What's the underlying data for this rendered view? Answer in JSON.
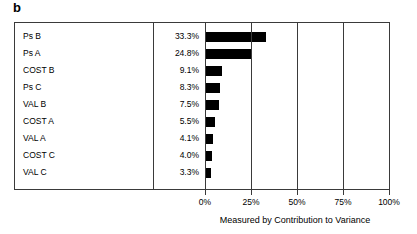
{
  "panel": {
    "label": "b"
  },
  "chart_data": {
    "type": "bar",
    "orientation": "horizontal",
    "title": "",
    "xlabel": "Measured by Contribution to Variance",
    "ylabel": "",
    "categories": [
      "Ps B",
      "Ps A",
      "COST B",
      "Ps C",
      "VAL B",
      "COST A",
      "VAL A",
      "COST C",
      "VAL C"
    ],
    "values": [
      33.3,
      24.8,
      9.1,
      8.3,
      7.5,
      5.5,
      4.1,
      4.0,
      3.3
    ],
    "value_labels": [
      "33.3%",
      "24.8%",
      "9.1%",
      "8.3%",
      "7.5%",
      "5.5%",
      "4.1%",
      "4.0%",
      "3.3%"
    ],
    "xlim": [
      0,
      100
    ],
    "xticks": [
      0,
      25,
      50,
      75,
      100
    ],
    "xtick_labels": [
      "0%",
      "25%",
      "50%",
      "75%",
      "100%"
    ],
    "grid": true,
    "legend": null,
    "bar_color": "#000000",
    "axis_color": "#3a3a3a"
  }
}
